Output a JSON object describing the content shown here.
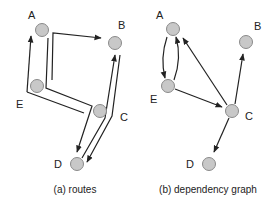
{
  "panels": [
    {
      "id": "routes",
      "caption": "(a) routes",
      "nodes": [
        {
          "id": "A",
          "label": "A"
        },
        {
          "id": "B",
          "label": "B"
        },
        {
          "id": "C",
          "label": "C"
        },
        {
          "id": "D",
          "label": "D"
        },
        {
          "id": "E",
          "label": "E"
        }
      ],
      "routes": [
        {
          "from": "E",
          "to": "A",
          "description": "route from E up to A"
        },
        {
          "from": "A",
          "to": "B",
          "description": "route from near A across to B"
        },
        {
          "from": "A",
          "to": "D",
          "description": "route from A down via E, across to near C, then down to D"
        },
        {
          "from": "C",
          "to": "B",
          "description": "route from D/C up to B"
        },
        {
          "from": "B",
          "to": "D",
          "description": "route from B down past C to D"
        }
      ]
    },
    {
      "id": "dependency-graph",
      "caption": "(b) dependency graph",
      "nodes": [
        {
          "id": "A",
          "label": "A"
        },
        {
          "id": "B",
          "label": "B"
        },
        {
          "id": "C",
          "label": "C"
        },
        {
          "id": "D",
          "label": "D"
        },
        {
          "id": "E",
          "label": "E"
        }
      ],
      "edges": [
        {
          "from": "A",
          "to": "E"
        },
        {
          "from": "E",
          "to": "A"
        },
        {
          "from": "C",
          "to": "A"
        },
        {
          "from": "C",
          "to": "B"
        },
        {
          "from": "E",
          "to": "C"
        },
        {
          "from": "C",
          "to": "D"
        }
      ]
    }
  ]
}
